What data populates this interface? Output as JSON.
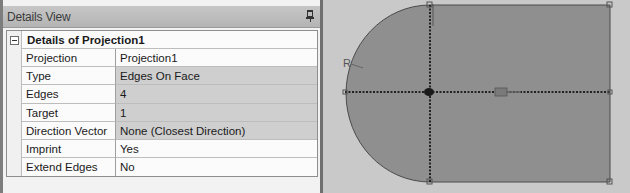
{
  "details_view": {
    "title": "Details View",
    "pin_icon": "pin-icon",
    "section": {
      "title": "Details of Projection1",
      "collapse_icon": "minus-box-icon"
    },
    "rows": [
      {
        "label": "Projection",
        "value": "Projection1"
      },
      {
        "label": "Type",
        "value": "Edges On Face"
      },
      {
        "label": "Edges",
        "value": "4"
      },
      {
        "label": "Target",
        "value": "1"
      },
      {
        "label": "Direction Vector",
        "value": "None (Closest Direction)"
      },
      {
        "label": "Imprint",
        "value": "Yes"
      },
      {
        "label": "Extend Edges",
        "value": "No"
      }
    ]
  },
  "viewport": {
    "sketch_labels": {
      "radius": "R",
      "horizontal": "H"
    },
    "colors": {
      "face_fill": "#8f8f8f",
      "background": "#c9c9c9",
      "edge": "#4a4a4a",
      "projected_edge": "#2a2a2a"
    }
  }
}
